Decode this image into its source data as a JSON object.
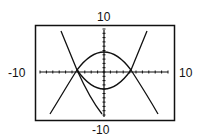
{
  "window": {
    "ymax_label": "10",
    "ymin_label": "-10",
    "xmin_label": "-10",
    "xmax_label": "10"
  },
  "chart_data": {
    "type": "line",
    "title": "",
    "xlabel": "",
    "ylabel": "",
    "xlim": [
      -10,
      10
    ],
    "ylim": [
      -10,
      10
    ],
    "grid": false,
    "axes_ticks": "unit tick marks every 1",
    "series": [
      {
        "name": "curve 1 (upper arc, opens down)",
        "points": [
          [
            -4.2,
            0
          ],
          [
            -2,
            2.6
          ],
          [
            0,
            3.3
          ],
          [
            2,
            2.6
          ],
          [
            4.2,
            0
          ]
        ]
      },
      {
        "name": "curve 2 (lower arc, opens up)",
        "points": [
          [
            -4.2,
            0
          ],
          [
            -2,
            -2.3
          ],
          [
            0,
            -3
          ],
          [
            2,
            -2.3
          ],
          [
            4.2,
            0
          ]
        ]
      },
      {
        "name": "steep curve A",
        "points": [
          [
            -6.9,
            8.9
          ],
          [
            -4.2,
            0
          ],
          [
            0,
            -3
          ],
          [
            4.2,
            0
          ],
          [
            5.8,
            8.9
          ]
        ]
      },
      {
        "name": "steep curve B",
        "points": [
          [
            -7.5,
            -7.5
          ],
          [
            -4.2,
            0
          ],
          [
            0,
            3.3
          ],
          [
            4.2,
            0
          ],
          [
            7.5,
            -7.5
          ]
        ]
      }
    ]
  }
}
